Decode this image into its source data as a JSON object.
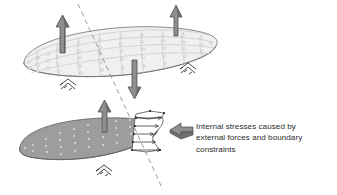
{
  "figure": {
    "background_color": "#ffffff",
    "annotation": {
      "lines": [
        "Internal stresses caused by",
        "external forces and boundary",
        "constraints"
      ],
      "full_text": "Internal stresses caused by external forces and boundary constraints",
      "text_color": "#2b2b2b"
    },
    "colors": {
      "outline": "#6e6e6e",
      "mesh_line": "#b4b4b4",
      "node_fill": "#ffffff",
      "node_stroke": "#9a9a9a",
      "plate_top_fill": "#f0f0f0",
      "plate_bottom_fill": "#9d9d9d",
      "arrow_fill": "#8c8c8c",
      "arrow_stroke": "#4f4f4f",
      "callout_arrow_fill": "#8c8c8c",
      "dashed_line": "#8a8a8a",
      "stress_outline": "#3a3a3a"
    },
    "parts": {
      "upper_plate": {
        "name": "meshed-elliptical-plate",
        "mesh_rows": 4,
        "mesh_cols": 9,
        "fill": "#f0f0f0"
      },
      "lower_plate": {
        "name": "sectioned-plate-half",
        "fill": "#9d9d9d"
      },
      "cut_line": {
        "name": "section-cut-plane",
        "style": "dashed",
        "from": [
          78,
          4
        ],
        "to": [
          163,
          190
        ]
      },
      "load_arrows": [
        {
          "id": "upper-left-load",
          "direction": "up"
        },
        {
          "id": "upper-right-load",
          "direction": "up"
        },
        {
          "id": "upper-center-load",
          "direction": "down"
        },
        {
          "id": "lower-left-load",
          "direction": "up"
        }
      ],
      "supports": [
        {
          "id": "upper-left-support"
        },
        {
          "id": "upper-right-support"
        },
        {
          "id": "lower-left-support"
        }
      ],
      "stress_distribution": {
        "name": "internal-stress-profile",
        "arrow_count": 5,
        "direction": "right"
      }
    }
  }
}
